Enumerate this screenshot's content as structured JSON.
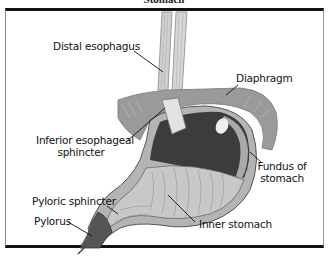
{
  "title": "Stomach",
  "labels": {
    "distal_esophagus": "Distal esophagus",
    "diaphragm": "Diaphragm",
    "inferior_esophageal_sphincter_line1": "Inferior esophageal",
    "inferior_esophageal_sphincter_line2": "sphincter",
    "fundus_line1": "Fundus of",
    "fundus_line2": "stomach",
    "pyloric_sphincter": "Pyloric sphincter",
    "pylorus": "Pylorus",
    "inner_stomach": "Inner stomach"
  },
  "colors": {
    "frame": "#111111",
    "diaphragm": "#9a9a9a",
    "stomach_dark": "#3c3c3c",
    "stomach_wall": "#b4b4b4",
    "inner_lining": "#c8c8c8",
    "esophagus": "#cfcfcf",
    "pylorus": "#555555"
  }
}
